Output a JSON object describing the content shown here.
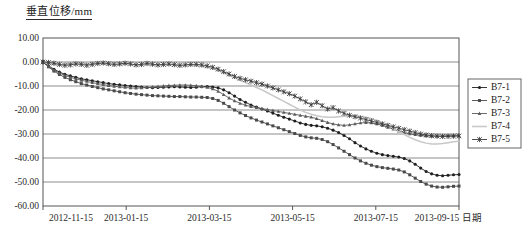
{
  "chart_data": {
    "type": "line",
    "title": "",
    "ylabel": "垂直位移/mm",
    "xlabel": "日期",
    "ylim": [
      -60,
      10
    ],
    "yticks": [
      10,
      0,
      -10,
      -20,
      -30,
      -40,
      -50,
      -60
    ],
    "ytick_labels": [
      "10.00",
      "0.00",
      "-10.00",
      "-20.00",
      "-30.00",
      "-40.00",
      "-50.00",
      "-60.00"
    ],
    "xtick_labels": [
      "2012-11-15",
      "2013-01-15",
      "2013-03-15",
      "2013-05-15",
      "2013-07-15",
      "2013-09-15"
    ],
    "xlim_days": [
      0,
      304
    ],
    "grid": true,
    "legend_position": "right",
    "series": [
      {
        "name": "B7-1",
        "marker": "circle",
        "color": "#1f1f1f",
        "x": [
          0,
          4,
          8,
          12,
          16,
          20,
          24,
          28,
          32,
          36,
          40,
          44,
          48,
          52,
          56,
          60,
          64,
          68,
          72,
          76,
          80,
          84,
          88,
          92,
          96,
          100,
          104,
          108,
          112,
          116,
          120,
          124,
          128,
          132,
          136,
          140,
          144,
          148,
          152,
          156,
          160,
          164,
          168,
          172,
          176,
          180,
          184,
          188,
          192,
          196,
          200,
          204,
          208,
          212,
          216,
          220,
          224,
          228,
          232,
          236,
          240,
          244,
          248,
          252,
          256,
          260,
          264,
          268,
          272,
          276,
          280,
          284,
          288,
          292,
          296,
          300,
          304
        ],
        "y": [
          0.0,
          -1.6,
          -3.0,
          -4.2,
          -5.1,
          -5.8,
          -6.4,
          -7.0,
          -7.4,
          -7.8,
          -8.2,
          -8.6,
          -9.0,
          -9.3,
          -9.5,
          -9.8,
          -10.0,
          -10.2,
          -10.4,
          -10.6,
          -10.7,
          -10.6,
          -10.5,
          -10.4,
          -10.3,
          -10.4,
          -10.5,
          -10.6,
          -10.5,
          -10.3,
          -10.2,
          -10.4,
          -10.8,
          -11.6,
          -12.8,
          -14.2,
          -15.6,
          -16.8,
          -17.9,
          -18.8,
          -19.6,
          -20.4,
          -21.3,
          -22.2,
          -23.0,
          -23.8,
          -24.6,
          -25.4,
          -26.0,
          -26.4,
          -26.6,
          -27.0,
          -27.6,
          -28.4,
          -29.4,
          -30.6,
          -32.0,
          -33.6,
          -35.0,
          -36.2,
          -37.2,
          -38.0,
          -38.6,
          -39.0,
          -39.3,
          -39.6,
          -40.2,
          -41.2,
          -42.6,
          -44.2,
          -45.6,
          -46.6,
          -47.2,
          -47.4,
          -47.2,
          -47.0,
          -46.9
        ]
      },
      {
        "name": "B7-2",
        "marker": "square",
        "color": "#4a4a4a",
        "x": [
          0,
          4,
          8,
          12,
          16,
          20,
          24,
          28,
          32,
          36,
          40,
          44,
          48,
          52,
          56,
          60,
          64,
          68,
          72,
          76,
          80,
          84,
          88,
          92,
          96,
          100,
          104,
          108,
          112,
          116,
          120,
          124,
          128,
          132,
          136,
          140,
          144,
          148,
          152,
          156,
          160,
          164,
          168,
          172,
          176,
          180,
          184,
          188,
          192,
          196,
          200,
          204,
          208,
          212,
          216,
          220,
          224,
          228,
          232,
          236,
          240,
          244,
          248,
          252,
          256,
          260,
          264,
          268,
          272,
          276,
          280,
          284,
          288,
          292,
          296,
          300,
          304
        ],
        "y": [
          0.0,
          -2.0,
          -3.8,
          -5.2,
          -6.4,
          -7.4,
          -8.2,
          -9.0,
          -9.6,
          -10.2,
          -10.7,
          -11.2,
          -11.6,
          -12.0,
          -12.4,
          -12.8,
          -13.1,
          -13.4,
          -13.6,
          -13.8,
          -14.0,
          -14.1,
          -14.2,
          -14.3,
          -14.4,
          -14.4,
          -14.5,
          -14.6,
          -14.6,
          -14.7,
          -14.8,
          -15.2,
          -16.0,
          -17.2,
          -18.6,
          -20.0,
          -21.2,
          -22.3,
          -23.3,
          -24.2,
          -25.0,
          -25.8,
          -26.6,
          -27.4,
          -28.2,
          -29.0,
          -29.8,
          -30.6,
          -31.2,
          -31.6,
          -31.8,
          -32.3,
          -33.2,
          -34.4,
          -35.8,
          -37.2,
          -38.6,
          -40.0,
          -41.2,
          -42.2,
          -43.0,
          -43.6,
          -44.0,
          -44.3,
          -44.6,
          -45.0,
          -45.8,
          -47.0,
          -48.4,
          -49.8,
          -50.9,
          -51.7,
          -52.1,
          -52.2,
          -52.0,
          -51.8,
          -51.7
        ]
      },
      {
        "name": "B7-3",
        "marker": "triangle",
        "color": "#5c5c5c",
        "x": [
          0,
          4,
          8,
          12,
          16,
          20,
          24,
          28,
          32,
          36,
          40,
          44,
          48,
          52,
          56,
          60,
          64,
          68,
          72,
          76,
          80,
          84,
          88,
          92,
          96,
          100,
          104,
          108,
          112,
          116,
          120,
          124,
          128,
          132,
          136,
          140,
          144,
          148,
          152,
          156,
          160,
          164,
          168,
          172,
          176,
          180,
          184,
          188,
          192,
          196,
          200,
          204,
          208,
          212,
          216,
          220,
          224,
          228,
          232,
          236,
          240,
          244,
          248,
          252,
          256,
          260,
          264,
          268,
          272,
          276,
          280,
          284,
          288,
          292,
          296,
          300,
          304
        ],
        "y": [
          0.0,
          -1.8,
          -3.4,
          -4.6,
          -5.6,
          -6.4,
          -7.0,
          -7.6,
          -8.1,
          -8.6,
          -9.0,
          -9.4,
          -9.8,
          -10.1,
          -10.4,
          -10.6,
          -10.8,
          -10.9,
          -10.8,
          -10.6,
          -10.4,
          -10.2,
          -10.0,
          -9.8,
          -9.7,
          -9.6,
          -9.6,
          -9.7,
          -9.9,
          -10.2,
          -10.6,
          -11.2,
          -12.2,
          -13.6,
          -15.0,
          -16.2,
          -17.2,
          -18.0,
          -18.6,
          -19.0,
          -19.4,
          -19.8,
          -20.2,
          -20.6,
          -21.0,
          -21.4,
          -21.8,
          -22.2,
          -22.6,
          -23.0,
          -23.6,
          -24.4,
          -25.2,
          -25.8,
          -26.2,
          -26.4,
          -26.2,
          -25.8,
          -25.4,
          -25.2,
          -25.4,
          -25.8,
          -26.4,
          -27.2,
          -28.0,
          -28.8,
          -29.4,
          -29.9,
          -30.3,
          -30.6,
          -30.8,
          -30.9,
          -30.9,
          -30.8,
          -30.7,
          -30.7,
          -30.7
        ]
      },
      {
        "name": "B7-4",
        "marker": "none",
        "color": "#c8c8c8",
        "x": [
          0,
          4,
          8,
          12,
          16,
          20,
          24,
          28,
          32,
          36,
          40,
          44,
          48,
          52,
          56,
          60,
          64,
          68,
          72,
          76,
          80,
          84,
          88,
          92,
          96,
          100,
          104,
          108,
          112,
          116,
          120,
          124,
          128,
          132,
          136,
          140,
          144,
          148,
          152,
          156,
          160,
          164,
          168,
          172,
          176,
          180,
          184,
          188,
          192,
          196,
          200,
          204,
          208,
          212,
          216,
          220,
          224,
          228,
          232,
          236,
          240,
          244,
          248,
          252,
          256,
          260,
          264,
          268,
          272,
          276,
          280,
          284,
          288,
          292,
          296,
          300,
          304
        ],
        "y": [
          0.0,
          -0.6,
          -1.0,
          -1.2,
          -1.0,
          -0.8,
          -0.6,
          -0.8,
          -1.0,
          -0.8,
          -0.6,
          -0.8,
          -1.0,
          -1.2,
          -1.0,
          -0.8,
          -1.0,
          -1.4,
          -1.2,
          -0.9,
          -1.1,
          -1.4,
          -1.2,
          -1.0,
          -1.3,
          -1.6,
          -1.4,
          -1.2,
          -1.5,
          -1.8,
          -2.2,
          -2.8,
          -3.6,
          -4.6,
          -5.6,
          -6.6,
          -7.6,
          -8.6,
          -9.6,
          -10.6,
          -11.6,
          -12.8,
          -14.0,
          -15.2,
          -16.4,
          -17.6,
          -18.8,
          -20.0,
          -21.0,
          -21.8,
          -22.4,
          -22.8,
          -23.0,
          -23.0,
          -22.8,
          -22.6,
          -22.4,
          -22.4,
          -22.6,
          -23.0,
          -23.6,
          -24.4,
          -25.4,
          -26.6,
          -27.8,
          -29.0,
          -30.2,
          -31.4,
          -32.4,
          -33.2,
          -33.8,
          -34.2,
          -34.2,
          -34.0,
          -33.6,
          -33.2,
          -33.0
        ]
      },
      {
        "name": "B7-5",
        "marker": "asterisk",
        "color": "#3a3a3a",
        "x": [
          0,
          4,
          8,
          12,
          16,
          20,
          24,
          28,
          32,
          36,
          40,
          44,
          48,
          52,
          56,
          60,
          64,
          68,
          72,
          76,
          80,
          84,
          88,
          92,
          96,
          100,
          104,
          108,
          112,
          116,
          120,
          124,
          128,
          132,
          136,
          140,
          144,
          148,
          152,
          156,
          160,
          164,
          168,
          172,
          176,
          180,
          184,
          188,
          192,
          196,
          200,
          204,
          208,
          212,
          216,
          220,
          224,
          228,
          232,
          236,
          240,
          244,
          248,
          252,
          256,
          260,
          264,
          268,
          272,
          276,
          280,
          284,
          288,
          292,
          296,
          300,
          304
        ],
        "y": [
          0.0,
          -0.2,
          -0.5,
          -1.0,
          -1.4,
          -1.2,
          -0.8,
          -1.0,
          -1.4,
          -1.0,
          -0.6,
          -0.4,
          -0.7,
          -1.0,
          -0.8,
          -0.5,
          -0.8,
          -1.2,
          -1.0,
          -0.6,
          -0.9,
          -1.2,
          -1.0,
          -0.8,
          -1.1,
          -1.4,
          -1.2,
          -1.0,
          -1.0,
          -1.2,
          -1.6,
          -2.2,
          -3.0,
          -4.0,
          -5.0,
          -6.0,
          -6.8,
          -7.4,
          -8.0,
          -8.6,
          -9.2,
          -10.0,
          -10.8,
          -11.6,
          -12.4,
          -13.2,
          -14.2,
          -15.4,
          -16.6,
          -17.8,
          -16.8,
          -18.2,
          -19.6,
          -19.0,
          -20.4,
          -21.4,
          -22.2,
          -22.8,
          -23.4,
          -24.0,
          -24.6,
          -25.2,
          -25.8,
          -26.4,
          -27.0,
          -27.6,
          -28.2,
          -28.8,
          -29.4,
          -30.0,
          -30.4,
          -30.7,
          -30.9,
          -31.0,
          -31.0,
          -30.9,
          -30.8
        ]
      }
    ]
  },
  "legend": {
    "entries": [
      {
        "label": "B7-1"
      },
      {
        "label": "B7-2"
      },
      {
        "label": "B7-3"
      },
      {
        "label": "B7-4"
      },
      {
        "label": "B7-5"
      }
    ]
  }
}
